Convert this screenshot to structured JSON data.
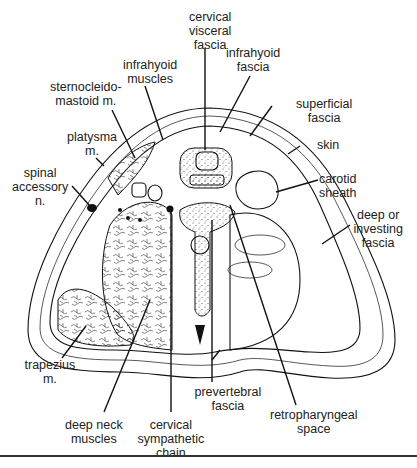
{
  "figure": {
    "labels": [
      {
        "id": "cervical-visceral-fascia",
        "text": "cervical\nvisceral\nfascia",
        "x": 210,
        "y": 10,
        "anchor": [
          205,
          150
        ]
      },
      {
        "id": "infrahyoid-muscles",
        "text": "infrahyoid\nmuscles",
        "x": 150,
        "y": 58,
        "anchor": [
          160,
          128
        ]
      },
      {
        "id": "infrahyoid-fascia",
        "text": "infrahyoid\nfascia",
        "x": 253,
        "y": 46,
        "anchor": [
          218,
          128
        ]
      },
      {
        "id": "sternocleidomastoid-m",
        "text": "sternocleido-\nmastoid m.",
        "x": 86,
        "y": 80,
        "anchor": [
          133,
          155
        ]
      },
      {
        "id": "superficial-fascia",
        "text": "superficial\nfascia",
        "x": 324,
        "y": 97,
        "anchor": [
          250,
          136
        ]
      },
      {
        "id": "platysma-m",
        "text": "platysma\nm.",
        "x": 92,
        "y": 130,
        "anchor": [
          100,
          162
        ]
      },
      {
        "id": "skin",
        "text": "skin",
        "x": 328,
        "y": 138,
        "anchor": [
          288,
          153
        ]
      },
      {
        "id": "spinal-accessory-n",
        "text": "spinal\naccessory\nn.",
        "x": 40,
        "y": 166,
        "anchor": [
          90,
          208
        ]
      },
      {
        "id": "carotid-sheath",
        "text": "carotid\nsheath",
        "x": 338,
        "y": 172,
        "anchor": [
          276,
          192
        ]
      },
      {
        "id": "deep-or-investing-fascia",
        "text": "deep or\ninvesting\nfascia",
        "x": 378,
        "y": 208,
        "anchor": [
          320,
          245
        ]
      },
      {
        "id": "trapezius-m",
        "text": "trapezius\nm.",
        "x": 50,
        "y": 358,
        "anchor": [
          88,
          320
        ]
      },
      {
        "id": "prevertebral-fascia",
        "text": "prevertebral\nfascia",
        "x": 228,
        "y": 385,
        "anchor": [
          213,
          355
        ]
      },
      {
        "id": "retropharyngeal-space",
        "text": "retropharyngeal\nspace",
        "x": 314,
        "y": 408,
        "anchor": [
          230,
          205
        ]
      },
      {
        "id": "deep-neck-muscles",
        "text": "deep neck\nmuscles",
        "x": 94,
        "y": 418,
        "anchor": [
          148,
          302
        ]
      },
      {
        "id": "cervical-sympathetic-chain",
        "text": "cervical\nsympathetic\nchain",
        "x": 171,
        "y": 418,
        "anchor": [
          171,
          210
        ]
      }
    ]
  }
}
